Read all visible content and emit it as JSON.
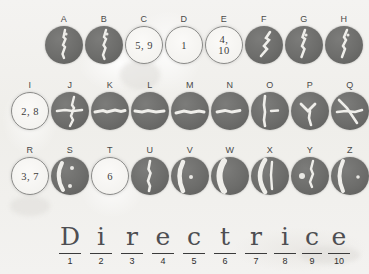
{
  "worksheet": {
    "background_color": "#f2f1ef",
    "disc_dark_color": "#6d6d6b",
    "disc_light_color": "#f6f5f2",
    "ink_color": "#4e4e52"
  },
  "rows": [
    {
      "row_name": "row-1",
      "items": [
        {
          "label": "A",
          "style": "dark",
          "value": "",
          "pattern": "vertical-streak"
        },
        {
          "label": "B",
          "style": "dark",
          "value": "",
          "pattern": "vertical-streak"
        },
        {
          "label": "C",
          "style": "light",
          "value": "5, 9",
          "pattern": "none"
        },
        {
          "label": "D",
          "style": "light",
          "value": "1",
          "pattern": "none"
        },
        {
          "label": "E",
          "style": "light",
          "value": "4, 10",
          "pattern": "none"
        },
        {
          "label": "F",
          "style": "dark",
          "value": "",
          "pattern": "diagonal-streak"
        },
        {
          "label": "G",
          "style": "dark",
          "value": "",
          "pattern": "vertical-streak"
        },
        {
          "label": "H",
          "style": "dark",
          "value": "",
          "pattern": "vertical-streak"
        }
      ]
    },
    {
      "row_name": "row-2",
      "items": [
        {
          "label": "I",
          "style": "light",
          "value": "2, 8",
          "pattern": "none"
        },
        {
          "label": "J",
          "style": "dark",
          "value": "",
          "pattern": "cross-streak"
        },
        {
          "label": "K",
          "style": "dark",
          "value": "",
          "pattern": "horizontal-streak"
        },
        {
          "label": "L",
          "style": "dark",
          "value": "",
          "pattern": "horizontal-streak"
        },
        {
          "label": "M",
          "style": "dark",
          "value": "",
          "pattern": "horizontal-streak"
        },
        {
          "label": "N",
          "style": "dark",
          "value": "",
          "pattern": "horizontal-streak"
        },
        {
          "label": "O",
          "style": "dark",
          "value": "",
          "pattern": "vertical-streak"
        },
        {
          "label": "P",
          "style": "dark",
          "value": "",
          "pattern": "y-streak"
        },
        {
          "label": "Q",
          "style": "dark",
          "value": "",
          "pattern": "cross-streak"
        }
      ]
    },
    {
      "row_name": "row-3",
      "items": [
        {
          "label": "R",
          "style": "light",
          "value": "3, 7",
          "pattern": "none"
        },
        {
          "label": "S",
          "style": "dark",
          "value": "",
          "pattern": "crescent-streak"
        },
        {
          "label": "T",
          "style": "light",
          "value": "6",
          "pattern": "none"
        },
        {
          "label": "U",
          "style": "dark",
          "value": "",
          "pattern": "vertical-streak"
        },
        {
          "label": "V",
          "style": "dark",
          "value": "",
          "pattern": "crescent-streak"
        },
        {
          "label": "W",
          "style": "dark",
          "value": "",
          "pattern": "crescent-streak"
        },
        {
          "label": "X",
          "style": "dark",
          "value": "",
          "pattern": "crescent-streak"
        },
        {
          "label": "Y",
          "style": "dark",
          "value": "",
          "pattern": "vertical-streak"
        },
        {
          "label": "Z",
          "style": "dark",
          "value": "",
          "pattern": "crescent-streak"
        }
      ]
    }
  ],
  "answer_line": {
    "word": "Directrice",
    "slots": [
      {
        "index": "1",
        "letter": "D"
      },
      {
        "index": "2",
        "letter": "i"
      },
      {
        "index": "3",
        "letter": "r"
      },
      {
        "index": "4",
        "letter": "e"
      },
      {
        "index": "5",
        "letter": "c"
      },
      {
        "index": "6",
        "letter": "t"
      },
      {
        "index": "7",
        "letter": "r"
      },
      {
        "index": "8",
        "letter": "i"
      },
      {
        "index": "9",
        "letter": "c"
      },
      {
        "index": "10",
        "letter": "e"
      }
    ]
  }
}
